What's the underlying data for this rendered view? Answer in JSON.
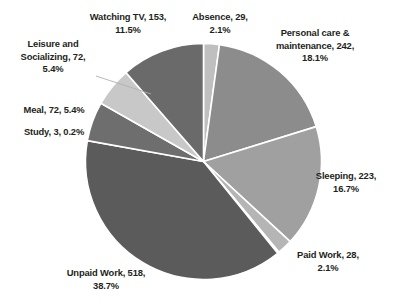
{
  "chart_data": {
    "type": "pie",
    "title": "",
    "subtitle": "",
    "xlabel": "",
    "ylabel": "",
    "legend_position": "labels-outside",
    "grid": false,
    "total": 1340,
    "units": "minutes per day",
    "start_angle_deg": -90,
    "direction": "clockwise",
    "categories": [
      "Absence",
      "Personal care & maintenance",
      "Sleeping",
      "Paid Work",
      "Study",
      "Unpaid Work",
      "Meal",
      "Leisure and Socializing",
      "Watching TV"
    ],
    "values": [
      29,
      242,
      223,
      28,
      3,
      518,
      72,
      72,
      153
    ],
    "percents": [
      2.1,
      18.1,
      16.7,
      2.1,
      0.2,
      38.7,
      5.4,
      5.4,
      11.5
    ],
    "colors": [
      "#bfbfbf",
      "#8c8c8c",
      "#a0a0a0",
      "#b5b5b5",
      "#cfcfcf",
      "#5b5b5b",
      "#6e6e6e",
      "#c8c8c8",
      "#6a6a6a"
    ],
    "slices": [
      {
        "name": "Absence",
        "value": 29,
        "percent": 2.1,
        "color": "#bfbfbf",
        "label": "Absence, 29, 2.1%"
      },
      {
        "name": "Personal care & maintenance",
        "value": 242,
        "percent": 18.1,
        "color": "#8c8c8c",
        "label": "Personal care & maintenance, 242, 18.1%"
      },
      {
        "name": "Sleeping",
        "value": 223,
        "percent": 16.7,
        "color": "#a0a0a0",
        "label": "Sleeping, 223, 16.7%"
      },
      {
        "name": "Paid Work",
        "value": 28,
        "percent": 2.1,
        "color": "#b5b5b5",
        "label": "Paid Work, 28, 2.1%"
      },
      {
        "name": "Study",
        "value": 3,
        "percent": 0.2,
        "color": "#cfcfcf",
        "label": "Study, 3, 0.2%"
      },
      {
        "name": "Unpaid Work",
        "value": 518,
        "percent": 38.7,
        "color": "#5b5b5b",
        "label": "Unpaid Work, 518, 38.7%"
      },
      {
        "name": "Meal",
        "value": 72,
        "percent": 5.4,
        "color": "#6e6e6e",
        "label": "Meal, 72, 5.4%"
      },
      {
        "name": "Leisure and Socializing",
        "value": 72,
        "percent": 5.4,
        "color": "#c8c8c8",
        "label": "Leisure and Socializing, 72, 5.4%"
      },
      {
        "name": "Watching TV",
        "value": 153,
        "percent": 11.5,
        "color": "#6a6a6a",
        "label": "Watching TV, 153, 11.5%"
      }
    ]
  },
  "labels": {
    "watching_tv": "Watching TV, 153, 11.5%",
    "absence": "Absence, 29, 2.1%",
    "personal_care": "Personal care & maintenance, 242, 18.1%",
    "leisure": "Leisure and Socializing, 72, 5.4%",
    "meal": "Meal, 72, 5.4%",
    "study": "Study, 3, 0.2%",
    "sleeping": "Sleeping, 223, 16.7%",
    "paid_work": "Paid Work, 28, 2.1%",
    "unpaid_work": "Unpaid Work, 518, 38.7%"
  },
  "style": {
    "background": "#ffffff",
    "text_color": "#231f20",
    "slice_border": "#ffffff",
    "leader_line": "#b0b0b0"
  }
}
